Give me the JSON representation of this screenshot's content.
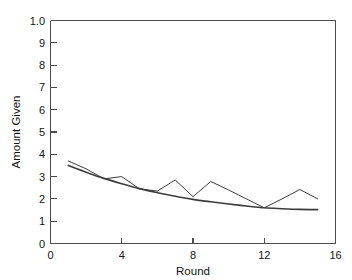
{
  "chart_data": {
    "type": "line",
    "title": "",
    "xlabel": "Round",
    "ylabel": "Amount Given",
    "xlim": [
      0,
      16
    ],
    "ylim": [
      0,
      10
    ],
    "grid": false,
    "legend": "none",
    "xticks": [
      0,
      4,
      8,
      12,
      16
    ],
    "xticklabels": [
      "0",
      "4",
      "8",
      "12",
      "16"
    ],
    "yticks": [
      0,
      1,
      2,
      3,
      4,
      5,
      6,
      7,
      8,
      9,
      10
    ],
    "yticklabels": [
      "0",
      "1",
      "2",
      "3",
      "4",
      "5",
      "6",
      "7",
      "8",
      "9",
      "1.0"
    ],
    "x": [
      1,
      2,
      3,
      4,
      5,
      6,
      7,
      8,
      9,
      10,
      11,
      12,
      13,
      14,
      15
    ],
    "series": [
      {
        "name": "observed",
        "style": "jagged-line",
        "color": "#3c3c3c",
        "values": [
          3.7,
          3.35,
          2.9,
          3.0,
          2.45,
          2.35,
          2.85,
          2.1,
          2.78,
          2.4,
          2.0,
          1.6,
          2.0,
          2.42,
          2.0
        ]
      },
      {
        "name": "fitted",
        "style": "smooth-curve",
        "color": "#3c3c3c",
        "values": [
          3.5,
          3.2,
          2.92,
          2.68,
          2.46,
          2.28,
          2.12,
          1.98,
          1.87,
          1.77,
          1.68,
          1.6,
          1.56,
          1.53,
          1.52
        ]
      }
    ]
  },
  "axes": {
    "x_axis_title": "Round",
    "y_axis_title": "Amount Given"
  }
}
